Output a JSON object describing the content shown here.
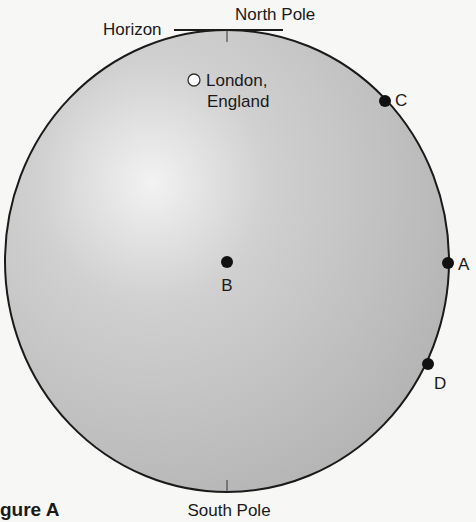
{
  "diagram": {
    "figure_label": "gure A",
    "globe": {
      "center": [
        227,
        261
      ],
      "rx": 222,
      "ry": 231,
      "fill": "#b9b9b9",
      "stroke": "#1a1a1a"
    },
    "labels": {
      "horizon": "Horizon",
      "north_pole": "North Pole",
      "south_pole": "South Pole",
      "london_line1": "London,",
      "london_line2": "England"
    },
    "points": [
      {
        "id": "A",
        "label": "A",
        "x": 448,
        "y": 263
      },
      {
        "id": "B",
        "label": "B",
        "x": 227,
        "y": 262
      },
      {
        "id": "C",
        "label": "C",
        "x": 385,
        "y": 101
      },
      {
        "id": "D",
        "label": "D",
        "x": 428,
        "y": 364
      }
    ],
    "london_marker": {
      "x": 194,
      "y": 80,
      "r": 6
    }
  }
}
